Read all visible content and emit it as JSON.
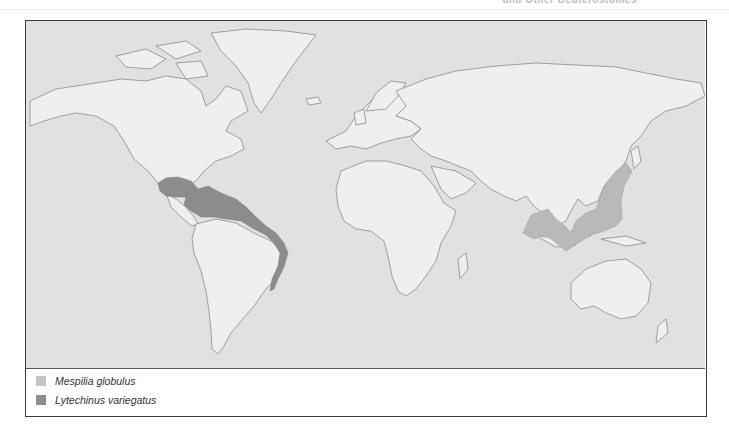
{
  "header": {
    "partial_title": "and Other Deuterostomes"
  },
  "map": {
    "title": "World distribution map",
    "colors": {
      "ocean": "#e1e1e1",
      "land": "#efefef",
      "coastline": "#8a8a8a",
      "mespilia": "#b9b9b9",
      "lytechinus": "#8c8c8c"
    }
  },
  "legend": {
    "items": [
      {
        "label": "Mespilia globulus",
        "color": "#c4c4c4"
      },
      {
        "label": "Lytechinus variegatus",
        "color": "#8e8e8e"
      }
    ]
  }
}
